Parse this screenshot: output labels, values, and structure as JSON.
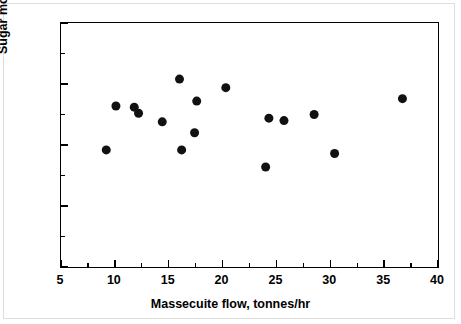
{
  "chart_data": {
    "type": "scatter",
    "title": "",
    "xlabel": "Massecuite flow,  tonnes/hr",
    "ylabel": "Sugar moisture,%",
    "xlim": [
      5,
      40
    ],
    "ylim": [
      0,
      2
    ],
    "grid": false,
    "legend": null,
    "marker": {
      "shape": "circle",
      "color": "#111111",
      "size_px": 9
    },
    "xticks": [
      5,
      10,
      15,
      20,
      25,
      30,
      35,
      40
    ],
    "xtick_labels": [
      "5",
      "10",
      "15",
      "20",
      "25",
      "30",
      "35",
      "40"
    ],
    "x_minor_ticks": [
      7.5,
      12.5,
      17.5,
      22.5,
      27.5,
      32.5,
      37.5
    ],
    "yticks": [
      0,
      0.5,
      1,
      1.5,
      2
    ],
    "ytick_labels": [
      "0",
      "0.5",
      "1",
      "1.5",
      "2"
    ],
    "y_minor_ticks": [
      0.25,
      0.75,
      1.25,
      1.75
    ],
    "points": [
      {
        "x": 9.2,
        "y": 0.96
      },
      {
        "x": 10.1,
        "y": 1.32
      },
      {
        "x": 11.8,
        "y": 1.31
      },
      {
        "x": 12.2,
        "y": 1.26
      },
      {
        "x": 14.4,
        "y": 1.19
      },
      {
        "x": 16.0,
        "y": 1.54
      },
      {
        "x": 16.2,
        "y": 0.96
      },
      {
        "x": 17.4,
        "y": 1.1
      },
      {
        "x": 17.6,
        "y": 1.36
      },
      {
        "x": 20.3,
        "y": 1.47
      },
      {
        "x": 24.0,
        "y": 0.82
      },
      {
        "x": 24.3,
        "y": 1.22
      },
      {
        "x": 25.7,
        "y": 1.2
      },
      {
        "x": 28.5,
        "y": 1.25
      },
      {
        "x": 30.4,
        "y": 0.93
      },
      {
        "x": 36.7,
        "y": 1.38
      }
    ]
  }
}
